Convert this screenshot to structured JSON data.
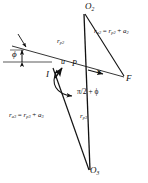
{
  "figure": {
    "type": "geometric-vector-diagram",
    "background_color": "#ffffff",
    "stroke_color": "#111111",
    "points": {
      "O2": {
        "label": "O",
        "sub": "2",
        "x": 88,
        "y": 9
      },
      "O3": {
        "label": "O",
        "sub": "3",
        "x": 93,
        "y": 172
      },
      "F": {
        "label": "F",
        "sub": "",
        "x": 126,
        "y": 79
      },
      "I": {
        "label": "I",
        "sub": "",
        "x": 47,
        "y": 75
      },
      "P": {
        "label": "P",
        "sub": "",
        "x": 73,
        "y": 66
      }
    },
    "vectors": {
      "u": {
        "label": "u",
        "x": 61,
        "y": 64
      },
      "v": {
        "label": "v",
        "x": 97,
        "y": 73
      }
    },
    "labels": {
      "r_p2": {
        "base": "r",
        "sub": "p2",
        "x": 60,
        "y": 42
      },
      "r_p3": {
        "base": "r",
        "sub": "p3",
        "x": 82,
        "y": 118
      },
      "phi": {
        "text": "ϕ",
        "x": 14,
        "y": 55
      },
      "angle_at_I": {
        "text": "π/2 + ϕ",
        "x": 78,
        "y": 92
      }
    },
    "equations": [
      {
        "id": "apoapsis-2",
        "text": "r_a2 = r_p2 + a2",
        "lhs_base": "r",
        "lhs_sub": "a2",
        "rhs_base": "r",
        "rhs_sub": "p2",
        "addend_base": "a",
        "addend_sub": "2",
        "x": 95,
        "y": 32
      },
      {
        "id": "apoapsis-3",
        "text": "r_a3 = r_p3 + a3",
        "lhs_base": "r",
        "lhs_sub": "a3",
        "rhs_base": "r",
        "rhs_sub": "p3",
        "addend_base": "a",
        "addend_sub": "3",
        "x": 10,
        "y": 115
      }
    ],
    "glyphs": {
      "equals": "=",
      "plus": "+"
    }
  }
}
